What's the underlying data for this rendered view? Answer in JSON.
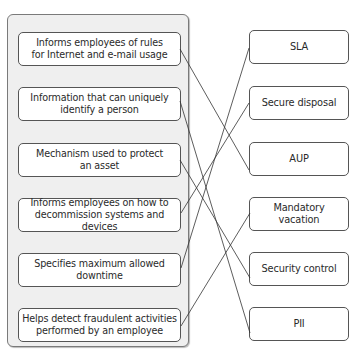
{
  "header": {
    "cut_off_text": "Figure 2-3"
  },
  "descriptions": [
    {
      "text": "Informs employees of rules for Internet and e-mail usage",
      "line1": "Informs employees of rules",
      "line2": "for Internet and e-mail usage"
    },
    {
      "text": "Information that can uniquely identify a person",
      "line1": "Information that can uniquely",
      "line2": "identify a person"
    },
    {
      "text": "Mechanism used to protect an asset",
      "line1": "Mechanism used to protect",
      "line2": "an asset"
    },
    {
      "text": "Informs employees on how to decommission systems and devices",
      "line1": "Informs employees on how to",
      "line2": "decommission systems and devices"
    },
    {
      "text": "Specifies maximum allowed downtime",
      "line1": "Specifies maximum allowed",
      "line2": "downtime"
    },
    {
      "text": "Helps detect fraudulent activities performed by an employee",
      "line1": "Helps detect fraudulent activities",
      "line2": "performed by an employee"
    }
  ],
  "terms": [
    {
      "label": "SLA"
    },
    {
      "label": "Secure disposal"
    },
    {
      "label": "AUP"
    },
    {
      "label": "Mandatory vacation"
    },
    {
      "label": "Security control"
    },
    {
      "label": "PII"
    }
  ],
  "connections": [
    {
      "from": 0,
      "to": 2,
      "from_label": "Informs employees of rules for Internet and e-mail usage",
      "to_label": "AUP"
    },
    {
      "from": 1,
      "to": 5,
      "from_label": "Information that can uniquely identify a person",
      "to_label": "PII"
    },
    {
      "from": 2,
      "to": 4,
      "from_label": "Mechanism used to protect an asset",
      "to_label": "Security control"
    },
    {
      "from": 3,
      "to": 1,
      "from_label": "Informs employees on how to decommission systems and devices",
      "to_label": "Secure disposal"
    },
    {
      "from": 4,
      "to": 0,
      "from_label": "Specifies maximum allowed downtime",
      "to_label": "SLA"
    },
    {
      "from": 5,
      "to": 3,
      "from_label": "Helps detect fraudulent activities performed by an employee",
      "to_label": "Mandatory vacation"
    }
  ],
  "colors": {
    "panel_bg": "#efefef",
    "box_border": "#555555",
    "line": "#333333"
  }
}
